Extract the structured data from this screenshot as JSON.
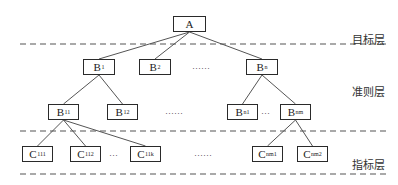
{
  "diagram": {
    "type": "hierarchy-tree",
    "colors": {
      "line": "#555555",
      "box_border": "#2a2a2a",
      "dash": "#555555",
      "text": "#222222"
    },
    "layers": [
      {
        "id": "goal",
        "label": "目标层",
        "x": 352,
        "y": 31
      },
      {
        "id": "criteria",
        "label": "准则层",
        "x": 352,
        "y": 83
      },
      {
        "id": "indicator",
        "label": "指标层",
        "x": 352,
        "y": 156
      }
    ],
    "dividers": [
      {
        "y": 44,
        "x1": 20,
        "x2": 386
      },
      {
        "y": 131,
        "x1": 20,
        "x2": 386
      },
      {
        "y": 174,
        "x1": 20,
        "x2": 386
      }
    ],
    "nodes": [
      {
        "id": "A",
        "base": "A",
        "sub": "",
        "x": 173,
        "y": 16,
        "w": 33
      },
      {
        "id": "B1",
        "base": "B",
        "sub": "1",
        "x": 83,
        "y": 59,
        "w": 32
      },
      {
        "id": "B2",
        "base": "B",
        "sub": "2",
        "x": 139,
        "y": 59,
        "w": 32
      },
      {
        "id": "Bn",
        "base": "B",
        "sub": "n",
        "x": 246,
        "y": 59,
        "w": 32
      },
      {
        "id": "B11",
        "base": "B",
        "sub": "11",
        "x": 48,
        "y": 104,
        "w": 31
      },
      {
        "id": "B12",
        "base": "B",
        "sub": "12",
        "x": 107,
        "y": 104,
        "w": 31
      },
      {
        "id": "Bn1",
        "base": "B",
        "sub": "n1",
        "x": 227,
        "y": 104,
        "w": 31
      },
      {
        "id": "Bnm",
        "base": "B",
        "sub": "nm",
        "x": 280,
        "y": 104,
        "w": 31
      },
      {
        "id": "C111",
        "base": "C",
        "sub": "111",
        "x": 22,
        "y": 146,
        "w": 31
      },
      {
        "id": "C112",
        "base": "C",
        "sub": "112",
        "x": 70,
        "y": 146,
        "w": 31
      },
      {
        "id": "C11k",
        "base": "C",
        "sub": "11k",
        "x": 130,
        "y": 146,
        "w": 31
      },
      {
        "id": "Cnm1",
        "base": "C",
        "sub": "nm1",
        "x": 252,
        "y": 146,
        "w": 31
      },
      {
        "id": "Cnm2",
        "base": "C",
        "sub": "nm2",
        "x": 297,
        "y": 146,
        "w": 31
      }
    ],
    "edges": [
      [
        "A",
        "B1"
      ],
      [
        "A",
        "B2"
      ],
      [
        "A",
        "Bn"
      ],
      [
        "B1",
        "B11"
      ],
      [
        "B1",
        "B12"
      ],
      [
        "Bn",
        "Bn1"
      ],
      [
        "Bn",
        "Bnm"
      ],
      [
        "B11",
        "C111"
      ],
      [
        "B11",
        "C112"
      ],
      [
        "B11",
        "C11k"
      ],
      [
        "Bnm",
        "Cnm1"
      ],
      [
        "Bnm",
        "Cnm2"
      ]
    ],
    "ellipses": [
      {
        "text": "……",
        "x": 192,
        "y": 61
      },
      {
        "text": "……",
        "x": 165,
        "y": 106
      },
      {
        "text": "…",
        "x": 261,
        "y": 106
      },
      {
        "text": "…",
        "x": 109,
        "y": 148
      },
      {
        "text": "……",
        "x": 194,
        "y": 148
      }
    ]
  }
}
